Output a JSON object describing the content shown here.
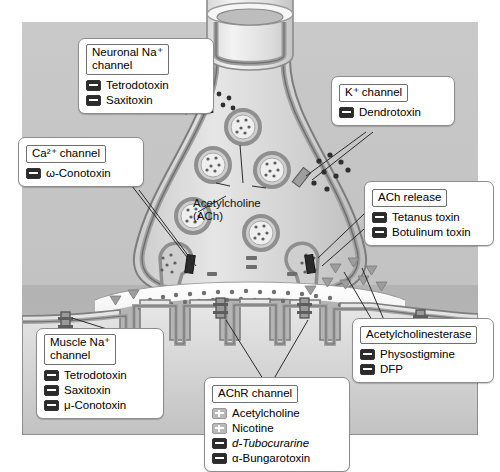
{
  "figure": {
    "center_label": {
      "line1": "Acetylcholine",
      "line2": "(ACh)"
    }
  },
  "colors": {
    "panel_top": "#c9c9c9",
    "panel_bottom": "#b3b3b3",
    "terminal_fill": "#dcdcdc",
    "membrane": "#8a8a8a",
    "vesicle_ring": "#9a9a9a",
    "inhibitor_chip": "#2b2b2b",
    "agonist_chip": "#b9b9b9"
  },
  "callouts": [
    {
      "id": "neuronal-na-channel",
      "title": "Neuronal Na⁺\nchannel",
      "items": [
        {
          "sign": "minus",
          "label": "Tetrodotoxin",
          "italic": false
        },
        {
          "sign": "minus",
          "label": "Saxitoxin",
          "italic": false
        }
      ]
    },
    {
      "id": "k-channel",
      "title": "K⁺ channel",
      "items": [
        {
          "sign": "minus",
          "label": "Dendrotoxin",
          "italic": false
        }
      ]
    },
    {
      "id": "ca-channel",
      "title": "Ca²⁺ channel",
      "items": [
        {
          "sign": "minus",
          "label": "ω-Conotoxin",
          "italic": false
        }
      ]
    },
    {
      "id": "ach-release",
      "title": "ACh release",
      "items": [
        {
          "sign": "minus",
          "label": "Tetanus toxin",
          "italic": false
        },
        {
          "sign": "minus",
          "label": "Botulinum toxin",
          "italic": false
        }
      ]
    },
    {
      "id": "muscle-na-channel",
      "title": "Muscle Na⁺\nchannel",
      "items": [
        {
          "sign": "minus",
          "label": "Tetrodotoxin",
          "italic": false
        },
        {
          "sign": "minus",
          "label": "Saxitoxin",
          "italic": false
        },
        {
          "sign": "minus",
          "label": "μ-Conotoxin",
          "italic": false
        }
      ]
    },
    {
      "id": "achr-channel",
      "title": "AChR channel",
      "items": [
        {
          "sign": "plus",
          "label": "Acetylcholine",
          "italic": false
        },
        {
          "sign": "plus",
          "label": "Nicotine",
          "italic": false
        },
        {
          "sign": "minus",
          "label": "d-Tubocurarine",
          "italic": true
        },
        {
          "sign": "minus",
          "label": "α-Bungarotoxin",
          "italic": false
        }
      ]
    },
    {
      "id": "acetylcholinesterase",
      "title": "Acetylcholinesterase",
      "items": [
        {
          "sign": "minus",
          "label": "Physostigmine",
          "italic": false
        },
        {
          "sign": "minus",
          "label": "DFP",
          "italic": false
        }
      ]
    }
  ]
}
